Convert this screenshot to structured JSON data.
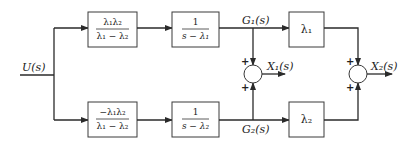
{
  "diagram": {
    "type": "block-diagram",
    "input": {
      "label": "U(s)"
    },
    "top_branch": {
      "gain_block": {
        "numerator": "λ₁λ₂",
        "denominator": "λ₁ − λ₂"
      },
      "integrator_block": {
        "numerator": "1",
        "denominator": "s − λ₁"
      },
      "signal_label": "G₁(s)",
      "scale_block": {
        "label": "λ₁"
      }
    },
    "bottom_branch": {
      "gain_block": {
        "numerator": "−λ₁λ₂",
        "denominator": "λ₁ − λ₂"
      },
      "integrator_block": {
        "numerator": "1",
        "denominator": "s − λ₂"
      },
      "signal_label": "G₂(s)",
      "scale_block": {
        "label": "λ₂"
      }
    },
    "summers": [
      {
        "output_label": "X₁(s)",
        "top_sign": "+",
        "bottom_sign": "+"
      },
      {
        "output_label": "X₂(s)",
        "top_sign": "+",
        "bottom_sign": "+"
      }
    ]
  }
}
